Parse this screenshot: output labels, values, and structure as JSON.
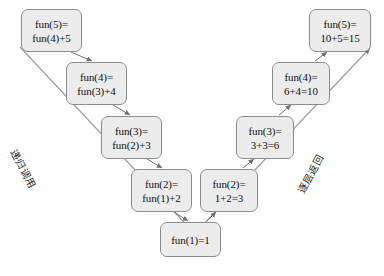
{
  "diagram": {
    "colors": {
      "node_fill": "#ececed",
      "node_border": "#8d8d8d",
      "edge": "#6f6f6f",
      "text": "#101010",
      "background": "#ffffff"
    },
    "descent_chain": [
      {
        "id": "call-fun5",
        "line1": "fun(5)=",
        "line2": "fun(4)+5",
        "x": 21,
        "y": 9,
        "w": 61,
        "h": 43
      },
      {
        "id": "call-fun4",
        "line1": "fun(4)=",
        "line2": "fun(3)+4",
        "x": 66,
        "y": 62,
        "w": 61,
        "h": 43
      },
      {
        "id": "call-fun3",
        "line1": "fun(3)=",
        "line2": "fun(2)+3",
        "x": 101,
        "y": 116,
        "w": 61,
        "h": 43
      },
      {
        "id": "call-fun2",
        "line1": "fun(2)=",
        "line2": "fun(1)+2",
        "x": 131,
        "y": 169,
        "w": 61,
        "h": 43
      }
    ],
    "base_case": {
      "id": "base-fun1",
      "line1": "fun(1)=1",
      "line2": "",
      "x": 160,
      "y": 222,
      "w": 61,
      "h": 35
    },
    "return_chain": [
      {
        "id": "return-fun2",
        "line1": "fun(2)=",
        "line2": "1+2=3",
        "x": 200,
        "y": 169,
        "w": 58,
        "h": 43
      },
      {
        "id": "return-fun3",
        "line1": "fun(3)=",
        "line2": "3+3=6",
        "x": 236,
        "y": 116,
        "w": 58,
        "h": 43
      },
      {
        "id": "return-fun4",
        "line1": "fun(4)=",
        "line2": "6+4=10",
        "x": 272,
        "y": 62,
        "w": 58,
        "h": 43
      },
      {
        "id": "return-fun5",
        "line1": "fun(5)=",
        "line2": "10+5=15",
        "x": 309,
        "y": 9,
        "w": 62,
        "h": 43
      }
    ],
    "flow_labels": {
      "descent": "递归调用",
      "ascent": "逐层返回"
    }
  }
}
